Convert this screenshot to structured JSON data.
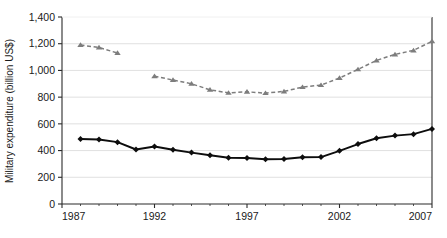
{
  "chart_data": {
    "type": "line",
    "title": "",
    "xlabel": "",
    "ylabel": "Military expenditure (billion US$)",
    "ylim": [
      0,
      1400
    ],
    "xlim": [
      1987,
      2007
    ],
    "yticks": [
      0,
      200,
      400,
      600,
      800,
      1000,
      1200,
      1400
    ],
    "ytick_labels": [
      "0",
      "200",
      "400",
      "600",
      "800",
      "1,000",
      "1,200",
      "1,400"
    ],
    "xticks": [
      1987,
      1992,
      1997,
      2002,
      2007
    ],
    "xtick_labels": [
      "1987",
      "1992",
      "1997",
      "2002",
      "2007"
    ],
    "grid": "horizontal",
    "legend": "none",
    "series": [
      {
        "name": "world-total",
        "color": "#7d7d7d",
        "marker": "triangle",
        "linestyle": "dashed",
        "x": [
          1988,
          1989,
          1990,
          1992,
          1993,
          1994,
          1995,
          1996,
          1997,
          1998,
          1999,
          2000,
          2001,
          2002,
          2003,
          2004,
          2005,
          2006,
          2007
        ],
        "values": [
          1190,
          1172,
          1130,
          957,
          928,
          900,
          855,
          832,
          840,
          830,
          843,
          875,
          890,
          943,
          1008,
          1075,
          1120,
          1150,
          1218
        ]
      },
      {
        "name": "usa",
        "color": "#0d0d0d",
        "marker": "diamond",
        "linestyle": "solid",
        "x": [
          1988,
          1989,
          1990,
          1991,
          1992,
          1993,
          1994,
          1995,
          1996,
          1997,
          1998,
          1999,
          2000,
          2001,
          2002,
          2003,
          2004,
          2005,
          2006,
          2007
        ],
        "values": [
          487,
          483,
          463,
          408,
          430,
          406,
          385,
          365,
          346,
          344,
          335,
          337,
          350,
          351,
          398,
          449,
          492,
          512,
          523,
          562
        ]
      }
    ]
  },
  "axes": {
    "y_axis_title": "Military expenditure (billion US$)"
  }
}
